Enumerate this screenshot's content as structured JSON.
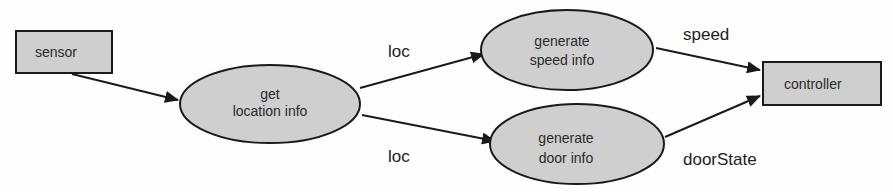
{
  "diagram": {
    "type": "data-flow",
    "colors": {
      "node_fill": "#cfcfcf",
      "stroke": "#1a1a1a",
      "background": "#fefefe"
    },
    "nodes": [
      {
        "id": "sensor",
        "shape": "rect",
        "label_lines": [
          "sensor"
        ]
      },
      {
        "id": "get_location",
        "shape": "ellipse",
        "label_lines": [
          "get",
          "location info"
        ]
      },
      {
        "id": "gen_speed",
        "shape": "ellipse",
        "label_lines": [
          "generate",
          "speed info"
        ]
      },
      {
        "id": "gen_door",
        "shape": "ellipse",
        "label_lines": [
          "generate",
          "door info"
        ]
      },
      {
        "id": "controller",
        "shape": "rect",
        "label_lines": [
          "controller"
        ]
      }
    ],
    "edges": [
      {
        "from": "sensor",
        "to": "get_location",
        "label": ""
      },
      {
        "from": "get_location",
        "to": "gen_speed",
        "label": "loc"
      },
      {
        "from": "get_location",
        "to": "gen_door",
        "label": "loc"
      },
      {
        "from": "gen_speed",
        "to": "controller",
        "label": "speed"
      },
      {
        "from": "gen_door",
        "to": "controller",
        "label": "doorState"
      }
    ]
  }
}
